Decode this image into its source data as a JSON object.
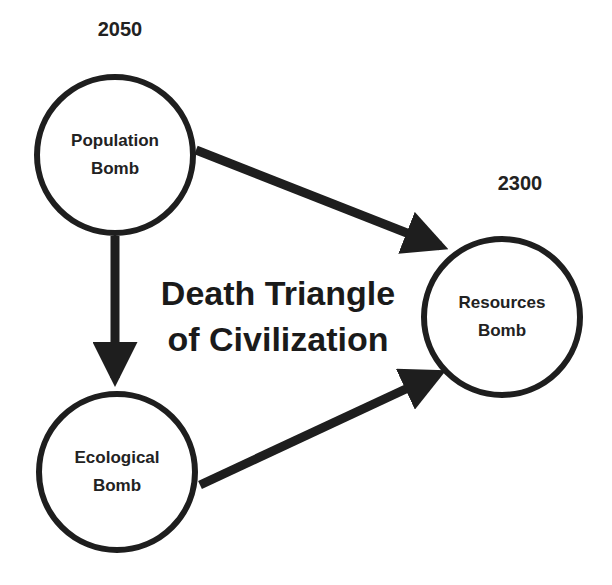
{
  "diagram": {
    "title_line1": "Death Triangle",
    "title_line2": "of Civilization",
    "colors": {
      "stroke": "#1e1e1e",
      "background": "#ffffff",
      "text": "#222222"
    },
    "nodes": [
      {
        "id": "population",
        "line1": "Population",
        "line2": "Bomb",
        "year": "2050"
      },
      {
        "id": "ecological",
        "line1": "Ecological",
        "line2": "Bomb"
      },
      {
        "id": "resources",
        "line1": "Resources",
        "line2": "Bomb",
        "year": "2300"
      }
    ],
    "edges": [
      {
        "from": "population",
        "to": "resources"
      },
      {
        "from": "population",
        "to": "ecological"
      },
      {
        "from": "ecological",
        "to": "resources"
      }
    ]
  }
}
